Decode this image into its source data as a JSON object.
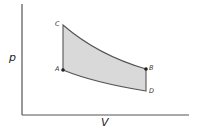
{
  "diagram": {
    "type": "pV-cycle",
    "axes": {
      "y_label": "p",
      "x_label": "V"
    },
    "points": [
      {
        "label": "A",
        "x": 63,
        "y": 70,
        "marker": true
      },
      {
        "label": "B",
        "x": 146,
        "y": 69,
        "marker": true
      },
      {
        "label": "C",
        "x": 63,
        "y": 25,
        "marker": false
      },
      {
        "label": "D",
        "x": 146,
        "y": 91,
        "marker": false
      }
    ],
    "edges": [
      {
        "from": "C",
        "to": "B",
        "kind": "curve"
      },
      {
        "from": "B",
        "to": "D",
        "kind": "vertical"
      },
      {
        "from": "D",
        "to": "A",
        "kind": "curve"
      },
      {
        "from": "A",
        "to": "C",
        "kind": "vertical"
      }
    ],
    "colors": {
      "fill": "#d9d9d9",
      "stroke": "#555555",
      "axis": "#555555",
      "marker": "#222222"
    }
  }
}
